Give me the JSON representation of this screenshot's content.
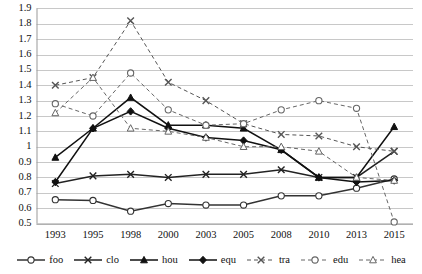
{
  "chart_data": {
    "type": "line",
    "title": "",
    "xlabel": "",
    "ylabel": "",
    "categories": [
      "1993",
      "1995",
      "1998",
      "2000",
      "2003",
      "2005",
      "2008",
      "2010",
      "2013",
      "2015"
    ],
    "ylim": [
      0.5,
      1.9
    ],
    "ytick_step": 0.1,
    "yticks": [
      "1.9",
      "1.8",
      "1.7",
      "1.6",
      "1.5",
      "1.4",
      "1.3",
      "1.2",
      "1.1",
      "1",
      "0.9",
      "0.8",
      "0.7",
      "0.6",
      "0.5"
    ],
    "grid": "horizontal",
    "legend_position": "bottom",
    "series": [
      {
        "name": "foo",
        "marker": "circle",
        "line_style": "solid",
        "color": "#333333",
        "values": [
          0.655,
          0.65,
          0.58,
          0.63,
          0.62,
          0.62,
          0.68,
          0.68,
          0.73,
          0.79
        ]
      },
      {
        "name": "clo",
        "marker": "x",
        "line_style": "solid",
        "color": "#222222",
        "values": [
          0.76,
          0.81,
          0.82,
          0.8,
          0.82,
          0.82,
          0.85,
          0.8,
          0.8,
          0.97
        ]
      },
      {
        "name": "hou",
        "marker": "triangle",
        "line_style": "solid",
        "color": "#111111",
        "values": [
          0.93,
          1.12,
          1.32,
          1.14,
          1.14,
          1.12,
          0.98,
          0.8,
          0.8,
          1.13
        ]
      },
      {
        "name": "equ",
        "marker": "diamond",
        "line_style": "solid",
        "color": "#111111",
        "values": [
          0.77,
          1.12,
          1.23,
          1.12,
          1.06,
          1.04,
          0.98,
          0.8,
          0.77,
          0.78
        ]
      },
      {
        "name": "tra",
        "marker": "x",
        "line_style": "dashed",
        "color": "#555555",
        "values": [
          1.4,
          1.45,
          1.82,
          1.42,
          1.3,
          1.15,
          1.08,
          1.07,
          1.0,
          0.97
        ]
      },
      {
        "name": "edu",
        "marker": "circle",
        "line_style": "dashed",
        "color": "#666666",
        "values": [
          1.28,
          1.2,
          1.48,
          1.24,
          1.14,
          1.15,
          1.24,
          1.3,
          1.25,
          0.51
        ]
      },
      {
        "name": "hea",
        "marker": "triangle",
        "line_style": "dashed",
        "color": "#666666",
        "values": [
          1.22,
          1.45,
          1.12,
          1.1,
          1.06,
          1.0,
          1.0,
          0.97,
          0.8,
          0.78
        ]
      }
    ]
  },
  "legend": {
    "items": [
      {
        "label": "foo",
        "icon": "line-circle-solid-icon"
      },
      {
        "label": "clo",
        "icon": "line-x-solid-icon"
      },
      {
        "label": "hou",
        "icon": "line-triangle-solid-icon"
      },
      {
        "label": "equ",
        "icon": "line-diamond-solid-icon"
      },
      {
        "label": "tra",
        "icon": "line-x-dashed-icon"
      },
      {
        "label": "edu",
        "icon": "line-circle-dashed-icon"
      },
      {
        "label": "hea",
        "icon": "line-triangle-dashed-icon"
      }
    ]
  },
  "style": {
    "grid_color": "#c8c8c8",
    "axis_color": "#999999",
    "text_color": "#111111",
    "background": "#ffffff"
  }
}
